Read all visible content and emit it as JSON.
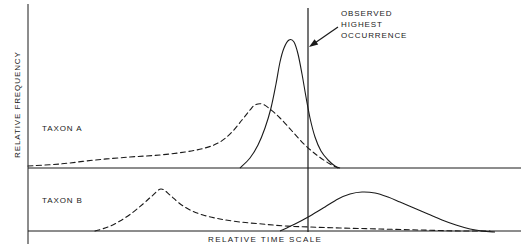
{
  "figure": {
    "axis_labels": {
      "y": "RELATIVE FREQUENCY",
      "x": "RELATIVE TIME SCALE"
    },
    "annotation": {
      "line1": "OBSERVED",
      "line2": "HIGHEST",
      "line3": "OCCURRENCE"
    },
    "panels": [
      {
        "label": "TAXON A"
      },
      {
        "label": "TAXON B"
      }
    ],
    "colors": {
      "ink": "#1a1a1a",
      "background": "#ffffff"
    }
  },
  "chart_data": {
    "type": "line",
    "title": "",
    "xlabel": "RELATIVE TIME SCALE",
    "ylabel": "RELATIVE FREQUENCY",
    "grid": false,
    "legend": "none",
    "axis_ranges": {
      "x_pixels": [
        28,
        521
      ],
      "panel_a_baseline_y": 168,
      "panel_b_baseline_y": 231,
      "panel_a_top_y": 8,
      "panel_b_top_y": 172
    },
    "reference_line": {
      "name": "OBSERVED HIGHEST OCCURRENCE",
      "orientation": "vertical",
      "x": 308,
      "y_top": 8,
      "y_bottom": 232,
      "style": "solid"
    },
    "annotation_arrow": {
      "from_x": 338,
      "from_y": 27,
      "to_x": 309,
      "to_y": 47
    },
    "panels": [
      {
        "name": "TAXON A",
        "baseline_y": 168,
        "series": [
          {
            "name": "taxon-a-dashed",
            "style": "dashed",
            "peak_x": 255,
            "peak_y": 105,
            "points": [
              [
                28,
                166
              ],
              [
                60,
                164
              ],
              [
                95,
                160
              ],
              [
                130,
                157
              ],
              [
                160,
                155
              ],
              [
                185,
                152
              ],
              [
                205,
                148
              ],
              [
                220,
                142
              ],
              [
                232,
                132
              ],
              [
                242,
                120
              ],
              [
                250,
                110
              ],
              [
                255,
                105
              ],
              [
                262,
                104
              ],
              [
                270,
                109
              ],
              [
                280,
                118
              ],
              [
                292,
                131
              ],
              [
                305,
                145
              ],
              [
                318,
                156
              ],
              [
                330,
                164
              ],
              [
                338,
                168
              ]
            ]
          },
          {
            "name": "taxon-a-solid",
            "style": "solid",
            "peak_x": 289,
            "peak_y": 40,
            "points": [
              [
                240,
                168
              ],
              [
                250,
                158
              ],
              [
                258,
                145
              ],
              [
                265,
                128
              ],
              [
                271,
                108
              ],
              [
                276,
                84
              ],
              [
                280,
                62
              ],
              [
                284,
                48
              ],
              [
                289,
                40
              ],
              [
                294,
                42
              ],
              [
                298,
                54
              ],
              [
                302,
                74
              ],
              [
                306,
                97
              ],
              [
                310,
                118
              ],
              [
                315,
                137
              ],
              [
                321,
                151
              ],
              [
                328,
                160
              ],
              [
                335,
                166
              ],
              [
                340,
                168
              ]
            ]
          }
        ]
      },
      {
        "name": "TAXON B",
        "baseline_y": 231,
        "series": [
          {
            "name": "taxon-b-dashed",
            "style": "dashed",
            "peak_x": 161,
            "peak_y": 189,
            "points": [
              [
                95,
                231
              ],
              [
                108,
                227
              ],
              [
                120,
                221
              ],
              [
                132,
                213
              ],
              [
                143,
                204
              ],
              [
                152,
                196
              ],
              [
                161,
                189
              ],
              [
                170,
                195
              ],
              [
                179,
                203
              ],
              [
                190,
                210
              ],
              [
                203,
                215
              ],
              [
                220,
                219
              ],
              [
                240,
                222
              ],
              [
                262,
                224
              ],
              [
                285,
                226
              ],
              [
                310,
                227
              ],
              [
                340,
                228
              ],
              [
                380,
                229
              ],
              [
                420,
                230
              ],
              [
                460,
                231
              ],
              [
                490,
                231
              ]
            ]
          },
          {
            "name": "taxon-b-solid",
            "style": "solid",
            "peak_x": 362,
            "peak_y": 192,
            "points": [
              [
                280,
                231
              ],
              [
                295,
                224
              ],
              [
                310,
                216
              ],
              [
                325,
                207
              ],
              [
                338,
                199
              ],
              [
                350,
                194
              ],
              [
                362,
                192
              ],
              [
                375,
                193
              ],
              [
                388,
                197
              ],
              [
                400,
                202
              ],
              [
                414,
                208
              ],
              [
                428,
                214
              ],
              [
                442,
                220
              ],
              [
                456,
                225
              ],
              [
                470,
                229
              ],
              [
                482,
                231
              ],
              [
                495,
                232
              ]
            ]
          }
        ]
      }
    ]
  }
}
